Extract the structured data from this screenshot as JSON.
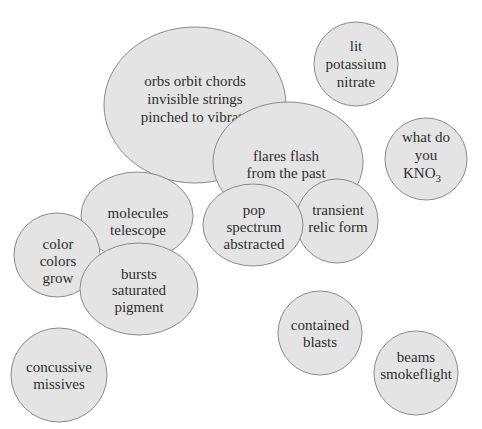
{
  "diagram": {
    "type": "bubble-cluster",
    "colors": {
      "bubble_fill": "#e4e4e4",
      "bubble_stroke": "#8a8a8a",
      "text": "#2e2e2e",
      "background": "#ffffff"
    },
    "bubbles": [
      {
        "id": "orbs",
        "lines": [
          "orbs orbit chords",
          "invisible strings",
          "pinched to vibrate"
        ]
      },
      {
        "id": "lit-potassium",
        "lines": [
          "lit",
          "potassium",
          "nitrate"
        ]
      },
      {
        "id": "flares",
        "lines": [
          "flares flash",
          "from the past"
        ]
      },
      {
        "id": "kno3",
        "lines": [
          "what do",
          "you"
        ],
        "formula": {
          "base": "KNO",
          "subscript": "3"
        }
      },
      {
        "id": "molecules",
        "lines": [
          "molecules",
          "telescope"
        ]
      },
      {
        "id": "pop",
        "lines": [
          "pop",
          "spectrum",
          "abstracted"
        ]
      },
      {
        "id": "transient",
        "lines": [
          "transient",
          "relic form"
        ]
      },
      {
        "id": "color",
        "lines": [
          "color",
          "colors",
          "grow"
        ]
      },
      {
        "id": "bursts",
        "lines": [
          "bursts",
          "saturated",
          "pigment"
        ]
      },
      {
        "id": "contained",
        "lines": [
          "contained",
          "blasts"
        ]
      },
      {
        "id": "concussive",
        "lines": [
          "concussive",
          "missives"
        ]
      },
      {
        "id": "beams",
        "lines": [
          "beams",
          "smokeflight"
        ]
      }
    ]
  }
}
